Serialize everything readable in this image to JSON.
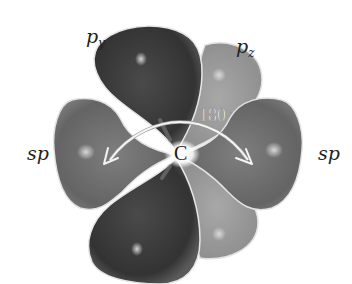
{
  "diagram": {
    "center_atom": "C",
    "angle_label": "180°",
    "labels": {
      "py_base": "p",
      "py_sub": "y",
      "pz_base": "p",
      "pz_sub": "z",
      "sp_left": "sp",
      "sp_right": "sp"
    },
    "colors": {
      "background": "#ffffff",
      "py_lobe": "#3c3c3c",
      "sp_lobe": "#6e6e6e",
      "pz_lobe": "#9a9a9a",
      "lobe_edge": "#e6e6e6",
      "arrow": "#f2f2f2"
    },
    "orbitals": [
      {
        "name": "p_y",
        "direction": "vertical",
        "shade": "dark"
      },
      {
        "name": "p_z",
        "direction": "behind-vertical",
        "shade": "light"
      },
      {
        "name": "sp",
        "direction": "left",
        "shade": "medium"
      },
      {
        "name": "sp",
        "direction": "right",
        "shade": "medium"
      }
    ]
  }
}
